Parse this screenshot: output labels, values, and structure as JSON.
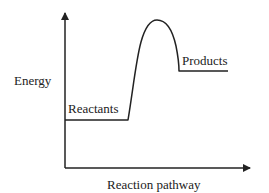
{
  "diagram": {
    "type": "energy-profile",
    "y_axis_label": "Energy",
    "x_axis_label": "Reaction pathway",
    "levels": {
      "reactants": {
        "label": "Reactants",
        "relative_energy": "low"
      },
      "products": {
        "label": "Products",
        "relative_energy": "intermediate"
      },
      "transition_state": {
        "label": "",
        "relative_energy": "high"
      }
    },
    "colors": {
      "line": "#222222",
      "text": "#222222",
      "background": "#ffffff"
    }
  }
}
